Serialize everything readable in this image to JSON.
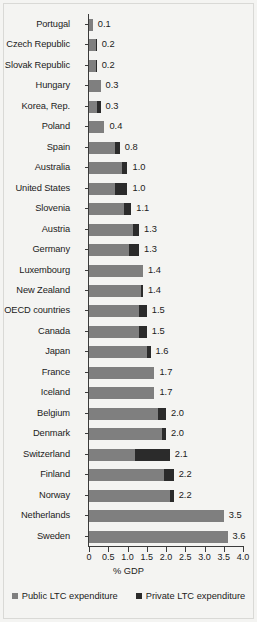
{
  "chart_data": {
    "type": "bar",
    "orientation": "horizontal",
    "stacked": true,
    "title": "",
    "xlabel": "% GDP",
    "ylabel": "",
    "xlim": [
      0,
      4.0
    ],
    "xticks": [
      0,
      0.5,
      1.0,
      1.5,
      2.0,
      2.5,
      3.0,
      3.5,
      4.0
    ],
    "xtick_labels": [
      "0",
      "0.5",
      "1.0",
      "1.5",
      "2.0",
      "2.5",
      "3.0",
      "3.5",
      "4.0"
    ],
    "grid": false,
    "legend_position": "bottom",
    "colors": {
      "public": "#7f7f7f",
      "private": "#2b2b2b",
      "background": "#f4f4f2",
      "axis": "#3b3b3b",
      "text": "#1b1b1b"
    },
    "series": [
      {
        "name": "Public LTC expenditure",
        "values": [
          0.1,
          0.17,
          0.17,
          0.3,
          0.22,
          0.4,
          0.67,
          0.85,
          0.67,
          0.9,
          1.15,
          1.05,
          1.4,
          1.35,
          1.3,
          1.3,
          1.5,
          1.7,
          1.7,
          1.8,
          1.9,
          1.2,
          1.95,
          2.1,
          3.5,
          3.6
        ]
      },
      {
        "name": "Private LTC expenditure",
        "values": [
          0.0,
          0.03,
          0.03,
          0.0,
          0.08,
          0.0,
          0.13,
          0.15,
          0.33,
          0.2,
          0.15,
          0.25,
          0.0,
          0.05,
          0.2,
          0.2,
          0.1,
          0.0,
          0.0,
          0.2,
          0.1,
          0.9,
          0.25,
          0.1,
          0.0,
          0.0
        ]
      }
    ],
    "categories": [
      "Portugal",
      "Czech Republic",
      "Slovak Republic",
      "Hungary",
      "Korea, Rep.",
      "Poland",
      "Spain",
      "Australia",
      "United States",
      "Slovenia",
      "Austria",
      "Germany",
      "Luxembourg",
      "New Zealand",
      "OECD countries",
      "Canada",
      "Japan",
      "France",
      "Iceland",
      "Belgium",
      "Denmark",
      "Switzerland",
      "Finland",
      "Norway",
      "Netherlands",
      "Sweden"
    ],
    "data_labels": [
      "0.1",
      "0.2",
      "0.2",
      "0.3",
      "0.3",
      "0.4",
      "0.8",
      "1.0",
      "1.0",
      "1.1",
      "1.3",
      "1.3",
      "1.4",
      "1.4",
      "1.5",
      "1.5",
      "1.6",
      "1.7",
      "1.7",
      "2.0",
      "2.0",
      "2.1",
      "2.2",
      "2.2",
      "3.5",
      "3.6"
    ],
    "totals": [
      0.1,
      0.2,
      0.2,
      0.3,
      0.3,
      0.4,
      0.8,
      1.0,
      1.0,
      1.1,
      1.3,
      1.3,
      1.4,
      1.4,
      1.5,
      1.5,
      1.6,
      1.7,
      1.7,
      2.0,
      2.0,
      2.1,
      2.2,
      2.2,
      3.5,
      3.6
    ]
  },
  "legend": {
    "items": [
      {
        "label": "Public LTC expenditure",
        "color": "#7f7f7f"
      },
      {
        "label": "Private LTC expenditure",
        "color": "#2b2b2b"
      }
    ]
  },
  "axis": {
    "x_title": "% GDP"
  }
}
